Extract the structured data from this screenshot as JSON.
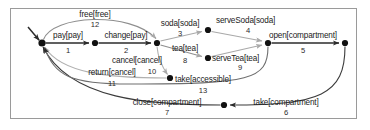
{
  "diagram": {
    "type": "state-machine",
    "frame": {
      "border_color": "#9a9a9a",
      "background": "#ffffff"
    },
    "colors": {
      "node": "#111111",
      "edge_dark": "#2b2b2b",
      "edge_light": "#a9a9a9",
      "text": "#1b1b1b"
    },
    "states": [
      {
        "id": "s_idle",
        "name": "idle-state",
        "x": 42,
        "y": 43,
        "initial": true
      },
      {
        "id": "s_paid",
        "name": "paid-state",
        "x": 95,
        "y": 43
      },
      {
        "id": "s_choice",
        "name": "choice-state",
        "x": 157,
        "y": 43
      },
      {
        "id": "s_soda",
        "name": "soda-served-state",
        "x": 208,
        "y": 30
      },
      {
        "id": "s_tea",
        "name": "tea-served-state",
        "x": 208,
        "y": 58
      },
      {
        "id": "s_ready",
        "name": "ready-state",
        "x": 268,
        "y": 43
      },
      {
        "id": "s_open",
        "name": "open-state",
        "x": 345,
        "y": 43
      },
      {
        "id": "s_cancelled",
        "name": "cancelled-state",
        "x": 170,
        "y": 78
      },
      {
        "id": "s_taken",
        "name": "taken-state",
        "x": 224,
        "y": 105
      }
    ],
    "transitions": [
      {
        "num": "1",
        "label": "pay[pay]",
        "from": "s_idle",
        "to": "s_paid",
        "name": "transition-pay"
      },
      {
        "num": "2",
        "label": "change[pay]",
        "from": "s_paid",
        "to": "s_choice",
        "name": "transition-change"
      },
      {
        "num": "3",
        "label": "soda[soda]",
        "from": "s_choice",
        "to": "s_soda",
        "name": "transition-soda"
      },
      {
        "num": "4",
        "label": "serveSoda[soda]",
        "from": "s_soda",
        "to": "s_ready",
        "name": "transition-serve-soda"
      },
      {
        "num": "5",
        "label": "open[compartment]",
        "from": "s_ready",
        "to": "s_open",
        "name": "transition-open"
      },
      {
        "num": "6",
        "label": "take[compartment]",
        "from": "s_open",
        "to": "s_taken",
        "name": "transition-take-compartment"
      },
      {
        "num": "7",
        "label": "close[compartment]",
        "from": "s_taken",
        "to": "s_idle",
        "name": "transition-close"
      },
      {
        "num": "8",
        "label": "tea[tea]",
        "from": "s_choice",
        "to": "s_tea",
        "name": "transition-tea"
      },
      {
        "num": "9",
        "label": "serveTea[tea]",
        "from": "s_tea",
        "to": "s_ready",
        "name": "transition-serve-tea"
      },
      {
        "num": "10",
        "label": "cancel[cancel]",
        "from": "s_choice",
        "to": "s_cancelled",
        "name": "transition-cancel"
      },
      {
        "num": "11",
        "label": "return[cancel]",
        "from": "s_cancelled",
        "to": "s_idle",
        "name": "transition-return"
      },
      {
        "num": "12",
        "label": "free[free]",
        "from": "s_idle",
        "to": "s_choice",
        "name": "transition-free"
      },
      {
        "num": "13",
        "label": "take[accessible]",
        "from": "s_ready",
        "to": "s_idle",
        "name": "transition-take-accessible"
      }
    ]
  }
}
